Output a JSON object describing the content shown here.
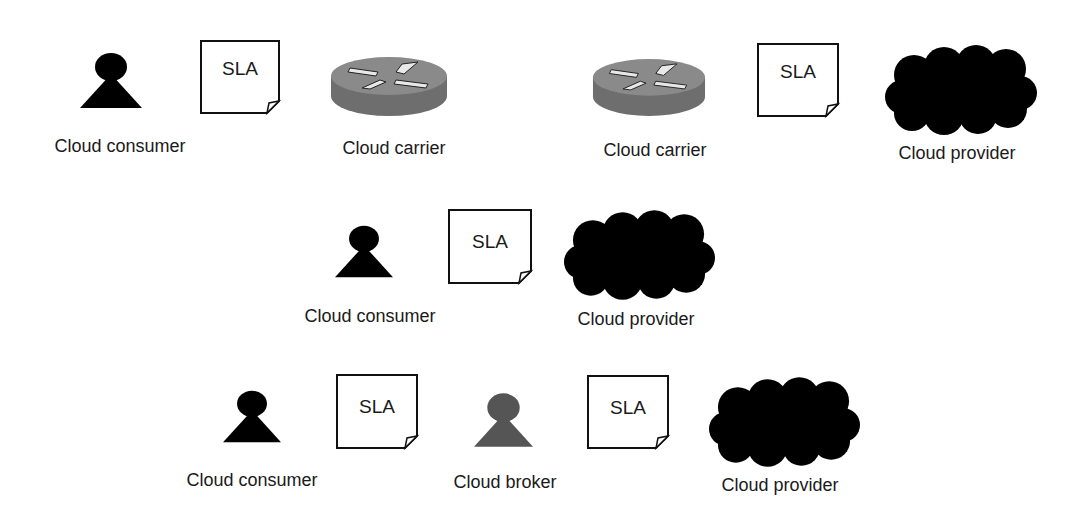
{
  "diagram": {
    "rows": [
      {
        "id": "row-1-left",
        "entities": [
          {
            "type": "person",
            "label": "Cloud consumer",
            "color": "#000000"
          },
          {
            "type": "document",
            "label": "SLA"
          },
          {
            "type": "router",
            "label": "Cloud carrier"
          }
        ]
      },
      {
        "id": "row-1-right",
        "entities": [
          {
            "type": "router",
            "label": "Cloud carrier"
          },
          {
            "type": "document",
            "label": "SLA"
          },
          {
            "type": "cloud",
            "label": "Cloud provider",
            "color": "#000000"
          }
        ]
      },
      {
        "id": "row-2",
        "entities": [
          {
            "type": "person",
            "label": "Cloud consumer",
            "color": "#000000"
          },
          {
            "type": "document",
            "label": "SLA"
          },
          {
            "type": "cloud",
            "label": "Cloud provider",
            "color": "#000000"
          }
        ]
      },
      {
        "id": "row-3",
        "entities": [
          {
            "type": "person",
            "label": "Cloud consumer",
            "color": "#000000"
          },
          {
            "type": "document",
            "label": "SLA"
          },
          {
            "type": "person",
            "label": "Cloud broker",
            "color": "#555555"
          },
          {
            "type": "document",
            "label": "SLA"
          },
          {
            "type": "cloud",
            "label": "Cloud provider",
            "color": "#000000"
          }
        ]
      }
    ]
  }
}
